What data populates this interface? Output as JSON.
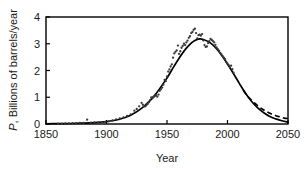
{
  "axes": {
    "x_title": "Year",
    "y_title": "P, Billions of barrels/year",
    "y_title_italic_prefix": "P",
    "y_title_rest": ", Billions of barrels/year",
    "x_ticks": [
      "1850",
      "1900",
      "1950",
      "2000",
      "2050"
    ],
    "y_ticks": [
      "0",
      "1",
      "2",
      "3",
      "4"
    ]
  },
  "chart_data": {
    "type": "line",
    "title": "",
    "xlabel": "Year",
    "ylabel": "P, Billions of barrels/year",
    "xlim": [
      1850,
      2050
    ],
    "ylim": [
      0,
      4
    ],
    "grid": false,
    "legend": "none",
    "x_ticks": [
      1850,
      1900,
      1950,
      2000,
      2050
    ],
    "y_ticks": [
      0,
      1,
      2,
      3,
      4
    ],
    "series": [
      {
        "name": "Observed production (data points)",
        "type": "scatter",
        "marker": "dot",
        "color": "#3a3a3a",
        "points": [
          [
            1860,
            0.01
          ],
          [
            1863,
            0.01
          ],
          [
            1866,
            0.02
          ],
          [
            1869,
            0.02
          ],
          [
            1872,
            0.03
          ],
          [
            1875,
            0.03
          ],
          [
            1878,
            0.04
          ],
          [
            1881,
            0.04
          ],
          [
            1884,
            0.16
          ],
          [
            1887,
            0.05
          ],
          [
            1890,
            0.06
          ],
          [
            1893,
            0.06
          ],
          [
            1896,
            0.07
          ],
          [
            1899,
            0.08
          ],
          [
            1902,
            0.1
          ],
          [
            1905,
            0.13
          ],
          [
            1908,
            0.17
          ],
          [
            1911,
            0.21
          ],
          [
            1914,
            0.25
          ],
          [
            1917,
            0.3
          ],
          [
            1920,
            0.36
          ],
          [
            1923,
            0.5
          ],
          [
            1925,
            0.56
          ],
          [
            1927,
            0.66
          ],
          [
            1929,
            0.79
          ],
          [
            1930,
            0.72
          ],
          [
            1931,
            0.65
          ],
          [
            1932,
            0.66
          ],
          [
            1933,
            0.7
          ],
          [
            1934,
            0.75
          ],
          [
            1935,
            0.81
          ],
          [
            1936,
            0.89
          ],
          [
            1937,
            0.99
          ],
          [
            1938,
            0.96
          ],
          [
            1939,
            1.01
          ],
          [
            1940,
            1.05
          ],
          [
            1941,
            1.07
          ],
          [
            1942,
            1.02
          ],
          [
            1943,
            1.1
          ],
          [
            1944,
            1.24
          ],
          [
            1945,
            1.3
          ],
          [
            1946,
            1.36
          ],
          [
            1947,
            1.47
          ],
          [
            1948,
            1.65
          ],
          [
            1949,
            1.6
          ],
          [
            1950,
            1.78
          ],
          [
            1951,
            1.96
          ],
          [
            1952,
            2.04
          ],
          [
            1953,
            2.15
          ],
          [
            1954,
            2.23
          ],
          [
            1955,
            2.48
          ],
          [
            1956,
            2.64
          ],
          [
            1957,
            2.7
          ],
          [
            1958,
            2.75
          ],
          [
            1959,
            2.93
          ],
          [
            1960,
            2.62
          ],
          [
            1961,
            2.72
          ],
          [
            1962,
            2.85
          ],
          [
            1963,
            2.92
          ],
          [
            1964,
            3.0
          ],
          [
            1965,
            2.95
          ],
          [
            1966,
            3.05
          ],
          [
            1967,
            3.12
          ],
          [
            1968,
            3.22
          ],
          [
            1969,
            3.28
          ],
          [
            1970,
            3.4
          ],
          [
            1971,
            3.44
          ],
          [
            1972,
            3.52
          ],
          [
            1973,
            3.56
          ],
          [
            1974,
            3.4
          ],
          [
            1975,
            3.2
          ],
          [
            1976,
            3.32
          ],
          [
            1977,
            3.34
          ],
          [
            1978,
            3.3
          ],
          [
            1979,
            3.36
          ],
          [
            1980,
            3.12
          ],
          [
            1981,
            2.95
          ],
          [
            1982,
            2.88
          ],
          [
            1983,
            2.9
          ],
          [
            1984,
            3.02
          ],
          [
            1985,
            3.1
          ],
          [
            1986,
            3.18
          ],
          [
            1987,
            3.14
          ],
          [
            1988,
            3.1
          ],
          [
            1989,
            3.05
          ],
          [
            1990,
            2.96
          ],
          [
            1991,
            2.86
          ],
          [
            1992,
            2.8
          ],
          [
            1993,
            2.74
          ],
          [
            1994,
            2.66
          ],
          [
            1995,
            2.6
          ],
          [
            1996,
            2.54
          ],
          [
            1997,
            2.48
          ],
          [
            1998,
            2.42
          ],
          [
            1999,
            2.32
          ],
          [
            2000,
            2.26
          ],
          [
            2001,
            2.2
          ],
          [
            2002,
            2.12
          ],
          [
            2003,
            2.18
          ],
          [
            2004,
            2.05
          ],
          [
            2005,
            1.92
          ]
        ]
      },
      {
        "name": "Logistic (Hubbert) fit",
        "type": "line",
        "style": "solid",
        "color": "#000000",
        "points": [
          [
            1850,
            0.01
          ],
          [
            1860,
            0.012
          ],
          [
            1870,
            0.018
          ],
          [
            1880,
            0.03
          ],
          [
            1890,
            0.05
          ],
          [
            1900,
            0.09
          ],
          [
            1910,
            0.17
          ],
          [
            1920,
            0.33
          ],
          [
            1930,
            0.62
          ],
          [
            1940,
            1.08
          ],
          [
            1950,
            1.72
          ],
          [
            1955,
            2.1
          ],
          [
            1960,
            2.46
          ],
          [
            1965,
            2.78
          ],
          [
            1970,
            3.02
          ],
          [
            1973,
            3.12
          ],
          [
            1977,
            3.18
          ],
          [
            1980,
            3.16
          ],
          [
            1985,
            3.06
          ],
          [
            1990,
            2.86
          ],
          [
            1995,
            2.58
          ],
          [
            2000,
            2.24
          ],
          [
            2005,
            1.88
          ],
          [
            2010,
            1.5
          ],
          [
            2015,
            1.14
          ],
          [
            2020,
            0.84
          ],
          [
            2025,
            0.6
          ],
          [
            2030,
            0.42
          ],
          [
            2035,
            0.28
          ],
          [
            2040,
            0.19
          ],
          [
            2045,
            0.12
          ],
          [
            2050,
            0.07
          ]
        ]
      },
      {
        "name": "Alternative projection",
        "type": "line",
        "style": "dashed",
        "color": "#000000",
        "points": [
          [
            2013,
            1.26
          ],
          [
            2016,
            1.08
          ],
          [
            2020,
            0.88
          ],
          [
            2024,
            0.72
          ],
          [
            2028,
            0.58
          ],
          [
            2032,
            0.47
          ],
          [
            2036,
            0.38
          ],
          [
            2040,
            0.31
          ],
          [
            2044,
            0.26
          ],
          [
            2047,
            0.22
          ],
          [
            2050,
            0.2
          ]
        ]
      }
    ],
    "annotations": [
      {
        "text": "peak of fitted curve",
        "x": 1976,
        "y": 3.18
      },
      {
        "text": "data outlier",
        "x": 1884,
        "y": 0.16
      }
    ]
  }
}
